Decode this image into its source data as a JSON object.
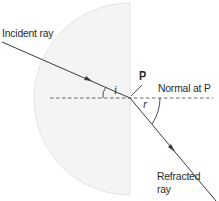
{
  "diagram": {
    "labels": {
      "incident_ray": "Incident ray",
      "point": "P",
      "normal": "Normal at P",
      "refracted_ray_line1": "Refracted",
      "refracted_ray_line2": "ray",
      "angle_incidence": "i",
      "angle_refraction": "r"
    },
    "colors": {
      "block_fill": "#f4f4f4",
      "block_edge": "#e6e6e6",
      "line": "#3a3a3a",
      "text": "#2a2a2a"
    }
  }
}
